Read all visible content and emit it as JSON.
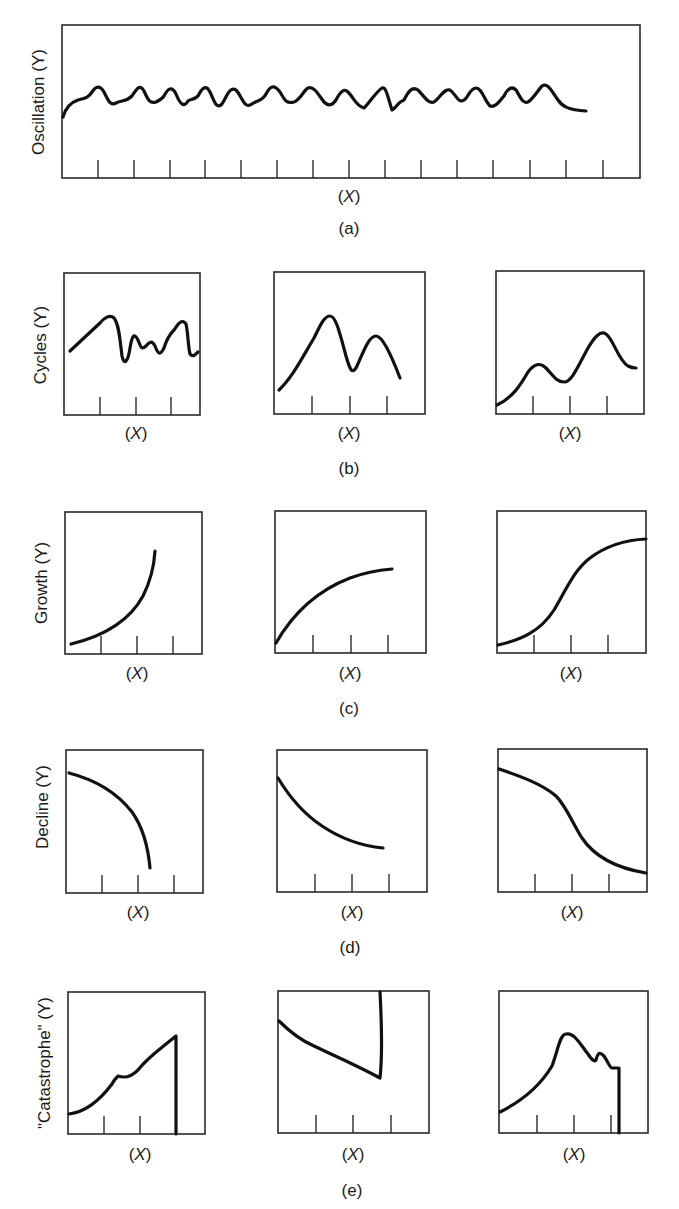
{
  "figure": {
    "x_axis_label_open": "(",
    "x_axis_label_var": "X",
    "x_axis_label_close": ")",
    "rows": [
      {
        "id": "a",
        "caption": "(a)",
        "y_label": "Oscillation (Y)",
        "panels": [
          {
            "shape": "regular oscillation (many small waves)"
          }
        ]
      },
      {
        "id": "b",
        "caption": "(b)",
        "y_label": "Cycles (Y)",
        "panels": [
          {
            "shape": "irregular cycles"
          },
          {
            "shape": "two peaks, large then smaller"
          },
          {
            "shape": "two peaks, smaller then larger"
          }
        ]
      },
      {
        "id": "c",
        "caption": "(c)",
        "y_label": "Growth (Y)",
        "panels": [
          {
            "shape": "exponential growth"
          },
          {
            "shape": "decelerating growth"
          },
          {
            "shape": "S-shaped (logistic) growth"
          }
        ]
      },
      {
        "id": "d",
        "caption": "(d)",
        "y_label": "Decline (Y)",
        "panels": [
          {
            "shape": "accelerating decline"
          },
          {
            "shape": "decelerating decline"
          },
          {
            "shape": "S-shaped decline"
          }
        ]
      },
      {
        "id": "e",
        "caption": "(e)",
        "y_label": "\"Catastrophe\" (Y)",
        "panels": [
          {
            "shape": "rise then sudden collapse"
          },
          {
            "shape": "decline then sudden jump"
          },
          {
            "shape": "rise, peak, fluctuation then sudden collapse"
          }
        ]
      }
    ],
    "colors": {
      "line": "#111111",
      "frame": "#2a2a2a",
      "background": "#ffffff"
    }
  }
}
